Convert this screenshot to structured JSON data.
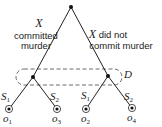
{
  "diagram": {
    "type": "game-tree",
    "root": {
      "label": ""
    },
    "branches": {
      "left": {
        "var": "X",
        "text": "committed",
        "text2": "murder"
      },
      "right": {
        "var": "X",
        "text": " did not",
        "text2": "commit murder"
      }
    },
    "information_set": {
      "label": "D"
    },
    "strategies": {
      "left_s1": {
        "main": "S",
        "sub": "1"
      },
      "left_s2": {
        "main": "S",
        "sub": "2"
      },
      "right_s1": {
        "main": "S",
        "sub": "1"
      },
      "right_s2": {
        "main": "S",
        "sub": "2"
      }
    },
    "outcomes": [
      {
        "main": "o",
        "sub": "1"
      },
      {
        "main": "o",
        "sub": "3"
      },
      {
        "main": "o",
        "sub": "2"
      },
      {
        "main": "o",
        "sub": "4"
      }
    ],
    "colors": {
      "line": "#222222",
      "background": "#ffffff"
    }
  }
}
